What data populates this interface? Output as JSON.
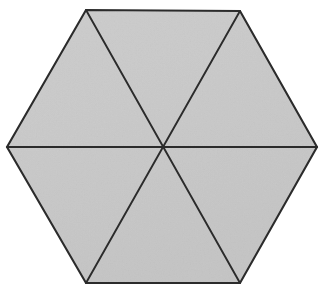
{
  "figure": {
    "name": "regular-hexagon-divided-into-six-triangles",
    "kind": "geometric-diagram",
    "canvas": {
      "width": 324,
      "height": 293,
      "background_color": "#ffffff"
    },
    "style": {
      "fill_color": "#c8c8c8",
      "fill_color_light": "#d2d2d2",
      "stroke_color": "#2b2b2b",
      "outline_stroke_width": 2.1,
      "diagonal_stroke_width": 1.9,
      "texture": "subtle-paper-grain"
    },
    "shape": {
      "type": "hexagon",
      "sides": 6,
      "orientation": "pointy-left-right",
      "center": {
        "x": 162,
        "y": 147
      },
      "vertices": [
        {
          "label": "left",
          "x": 7,
          "y": 147
        },
        {
          "label": "top-left",
          "x": 86,
          "y": 10
        },
        {
          "label": "top-right",
          "x": 240,
          "y": 11
        },
        {
          "label": "right",
          "x": 317,
          "y": 147
        },
        {
          "label": "bottom-right",
          "x": 240,
          "y": 283
        },
        {
          "label": "bottom-left",
          "x": 86,
          "y": 283
        }
      ],
      "polygon_points": "7,147 86,10 240,11 317,147 240,283 86,283",
      "diagonals": [
        {
          "label": "horizontal-diagonal",
          "from": "left",
          "to": "right",
          "x1": 7,
          "y1": 147,
          "x2": 317,
          "y2": 147
        },
        {
          "label": "top-left-to-bottom-right-diagonal",
          "from": "top-left",
          "to": "bottom-right",
          "x1": 86,
          "y1": 10,
          "x2": 240,
          "y2": 283
        },
        {
          "label": "top-right-to-bottom-left-diagonal",
          "from": "top-right",
          "to": "bottom-left",
          "x1": 240,
          "y1": 11,
          "x2": 86,
          "y2": 283
        }
      ],
      "triangles": [
        {
          "label": "triangle-top",
          "points": "162,147 86,10 240,11"
        },
        {
          "label": "triangle-upper-right",
          "points": "162,147 240,11 317,147"
        },
        {
          "label": "triangle-lower-right",
          "points": "162,147 317,147 240,283"
        },
        {
          "label": "triangle-bottom",
          "points": "162,147 240,283 86,283"
        },
        {
          "label": "triangle-lower-left",
          "points": "162,147 86,283 7,147"
        },
        {
          "label": "triangle-upper-left",
          "points": "162,147 7,147 86,10"
        }
      ],
      "triangle_count": 6
    }
  }
}
